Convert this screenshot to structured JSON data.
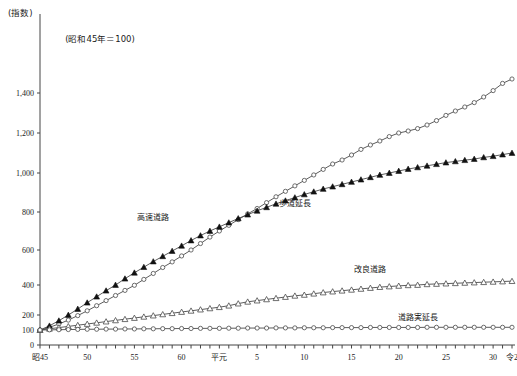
{
  "axis_unit_label": "(指数)",
  "base_note": "(昭和45年＝100)",
  "chart_data": {
    "type": "line",
    "title": "",
    "subtitle": "(昭和45年＝100)",
    "xlabel": "",
    "ylabel": "(指数)",
    "grid": false,
    "legend_position": "inline-labels",
    "ylim": [
      0,
      1450
    ],
    "ytick_values": [
      0,
      100,
      200,
      400,
      600,
      800,
      1000,
      1200,
      1400
    ],
    "ytick_labels": [
      "0",
      "100",
      "200",
      "400",
      "600",
      "800",
      "1,000",
      "1,200",
      "1,400"
    ],
    "x": [
      1970,
      1971,
      1972,
      1973,
      1974,
      1975,
      1976,
      1977,
      1978,
      1979,
      1980,
      1981,
      1982,
      1983,
      1984,
      1985,
      1986,
      1987,
      1988,
      1989,
      1990,
      1991,
      1992,
      1993,
      1994,
      1995,
      1996,
      1997,
      1998,
      1999,
      2000,
      2001,
      2002,
      2003,
      2004,
      2005,
      2006,
      2007,
      2008,
      2009,
      2010,
      2011,
      2012,
      2013,
      2014,
      2015,
      2016,
      2017,
      2018,
      2019,
      2020
    ],
    "xtick_labels": [
      {
        "x": 1970,
        "label": "昭45"
      },
      {
        "x": 1975,
        "label": "50"
      },
      {
        "x": 1980,
        "label": "55"
      },
      {
        "x": 1985,
        "label": "60"
      },
      {
        "x": 1989,
        "label": "平元"
      },
      {
        "x": 1993,
        "label": "5"
      },
      {
        "x": 1998,
        "label": "10"
      },
      {
        "x": 2003,
        "label": "15"
      },
      {
        "x": 2008,
        "label": "20"
      },
      {
        "x": 2013,
        "label": "25"
      },
      {
        "x": 2018,
        "label": "30"
      },
      {
        "x": 2020,
        "label": "令2"
      }
    ],
    "series": [
      {
        "name": "高速道路",
        "marker": "open-circle",
        "label_x": 1982,
        "label_y": 760,
        "values": [
          100,
          118,
          140,
          166,
          196,
          228,
          262,
          296,
          330,
          364,
          398,
          432,
          466,
          500,
          532,
          566,
          600,
          634,
          668,
          700,
          730,
          760,
          790,
          818,
          848,
          878,
          906,
          934,
          962,
          990,
          1018,
          1045,
          1065,
          1090,
          1118,
          1140,
          1160,
          1182,
          1200,
          1210,
          1222,
          1240,
          1262,
          1288,
          1310,
          1330,
          1352,
          1380,
          1412,
          1448,
          1470
        ]
      },
      {
        "name": "歩道延長",
        "marker": "filled-triangle",
        "label_x": 1997,
        "label_y": 830,
        "values": [
          100,
          128,
          162,
          200,
          240,
          282,
          322,
          362,
          400,
          436,
          470,
          502,
          534,
          564,
          594,
          622,
          650,
          676,
          700,
          722,
          744,
          766,
          786,
          806,
          824,
          842,
          858,
          874,
          890,
          904,
          918,
          930,
          942,
          954,
          966,
          978,
          990,
          1000,
          1010,
          1020,
          1028,
          1036,
          1044,
          1052,
          1058,
          1064,
          1070,
          1078,
          1084,
          1092,
          1100
        ]
      },
      {
        "name": "改良道路",
        "marker": "open-triangle",
        "label_x": 2005,
        "label_y": 472,
        "values": [
          100,
          108,
          116,
          124,
          132,
          140,
          148,
          156,
          164,
          172,
          180,
          188,
          196,
          204,
          212,
          220,
          228,
          236,
          244,
          252,
          262,
          276,
          288,
          296,
          304,
          312,
          320,
          328,
          334,
          342,
          350,
          356,
          362,
          368,
          374,
          380,
          386,
          390,
          394,
          398,
          400,
          404,
          406,
          408,
          410,
          412,
          414,
          416,
          418,
          420,
          422
        ]
      },
      {
        "name": "道路実延長",
        "marker": "open-circle",
        "label_x": 2010,
        "label_y": 168,
        "values": [
          100,
          101,
          102,
          103,
          104,
          105,
          105,
          106,
          106,
          107,
          107,
          108,
          108,
          109,
          109,
          110,
          110,
          111,
          111,
          111,
          112,
          112,
          113,
          113,
          113,
          114,
          114,
          114,
          115,
          115,
          115,
          116,
          116,
          116,
          116,
          117,
          117,
          117,
          117,
          117,
          117,
          118,
          118,
          118,
          118,
          118,
          118,
          118,
          118,
          118,
          118
        ]
      }
    ]
  }
}
